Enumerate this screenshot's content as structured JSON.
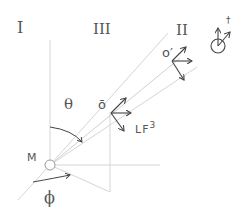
{
  "labels": {
    "region_I": "I",
    "region_III": "III",
    "region_II": "II",
    "theta": "θ",
    "phi": "ϕ",
    "origin": "M",
    "o_bar": "ō",
    "o_prime": "o′",
    "lf": "LF",
    "lf_sup": "3",
    "dagger": "†"
  },
  "colors": {
    "line": "#cfcfcf",
    "arrow": "#444444",
    "text": "#555555"
  }
}
